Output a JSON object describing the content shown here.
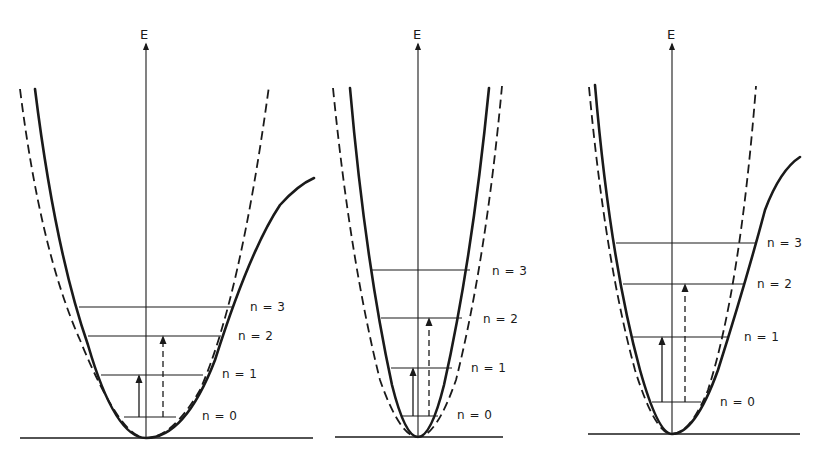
{
  "figure": {
    "ink_color": "#1a1a1a",
    "background": "#ffffff"
  },
  "panels": [
    {
      "id": "panel-1",
      "axis_label": "E",
      "axis": {
        "x": 146,
        "y_top": 44,
        "y_bottom": 438
      },
      "axis_label_pos": {
        "x": 140,
        "y": 29
      },
      "baseline": {
        "x1": 20,
        "x2": 313,
        "y": 438
      },
      "harmonic_dashed": "M20,89 Q40,250 80,340 Q120,438 146,438 Q172,438 200,390 Q240,300 269,86",
      "anharmonic_solid": "M35,89 Q55,250 88,345 Q115,438 146,438 Q185,438 215,360 Q250,250 280,205 Q298,185 314,178",
      "levels": [
        {
          "label": "n = 0",
          "y": 417,
          "x1": 124,
          "x2": 176,
          "label_x": 202,
          "label_y": 410
        },
        {
          "label": "n = 1",
          "y": 375,
          "x1": 101,
          "x2": 203,
          "label_x": 222,
          "label_y": 368
        },
        {
          "label": "n = 2",
          "y": 336,
          "x1": 88,
          "x2": 221,
          "label_x": 238,
          "label_y": 330
        },
        {
          "label": "n = 3",
          "y": 307,
          "x1": 79,
          "x2": 232,
          "label_x": 250,
          "label_y": 301
        }
      ],
      "solid_arrow": {
        "x": 139,
        "y_from": 417,
        "y_to": 375
      },
      "dashed_arrow": {
        "x": 163,
        "y_from": 417,
        "y_to": 336
      }
    },
    {
      "id": "panel-2",
      "axis_label": "E",
      "axis": {
        "x": 418,
        "y_top": 44,
        "y_bottom": 437
      },
      "axis_label_pos": {
        "x": 413,
        "y": 29
      },
      "baseline": {
        "x1": 335,
        "x2": 503,
        "y": 437
      },
      "harmonic_dashed": "M333,88 Q350,260 380,380 Q400,437 418,437 Q436,437 456,380 Q486,260 502,86",
      "anharmonic_solid": "M350,88 Q365,260 392,385 Q405,437 418,437 Q431,437 444,385 Q472,260 489,88",
      "levels": [
        {
          "label": "n = 0",
          "y": 416,
          "x1": 402,
          "x2": 438,
          "label_x": 457,
          "label_y": 409
        },
        {
          "label": "n = 1",
          "y": 368,
          "x1": 391,
          "x2": 452,
          "label_x": 471,
          "label_y": 362
        },
        {
          "label": "n = 2",
          "y": 318,
          "x1": 381,
          "x2": 462,
          "label_x": 483,
          "label_y": 313
        },
        {
          "label": "n = 3",
          "y": 270,
          "x1": 372,
          "x2": 470,
          "label_x": 492,
          "label_y": 265
        }
      ],
      "solid_arrow": {
        "x": 413,
        "y_from": 416,
        "y_to": 368
      },
      "dashed_arrow": {
        "x": 429,
        "y_from": 416,
        "y_to": 318
      }
    },
    {
      "id": "panel-3",
      "axis_label": "E",
      "axis": {
        "x": 672,
        "y_top": 44,
        "y_bottom": 434
      },
      "axis_label_pos": {
        "x": 667,
        "y": 29
      },
      "baseline": {
        "x1": 588,
        "x2": 800,
        "y": 434
      },
      "harmonic_dashed": "M589,87 Q605,260 635,370 Q655,434 672,434 Q690,434 708,390 Q740,290 756,86",
      "anharmonic_solid": "M595,85 Q610,260 640,370 Q658,434 672,434 Q695,434 718,370 Q745,285 765,210 Q780,170 800,157",
      "levels": [
        {
          "label": "n = 0",
          "y": 402,
          "x1": 652,
          "x2": 701,
          "label_x": 720,
          "label_y": 396
        },
        {
          "label": "n = 1",
          "y": 337,
          "x1": 633,
          "x2": 728,
          "label_x": 744,
          "label_y": 331
        },
        {
          "label": "n = 2",
          "y": 284,
          "x1": 623,
          "x2": 745,
          "label_x": 757,
          "label_y": 278
        },
        {
          "label": "n = 3",
          "y": 243,
          "x1": 616,
          "x2": 755,
          "label_x": 767,
          "label_y": 237
        }
      ],
      "solid_arrow": {
        "x": 662,
        "y_from": 402,
        "y_to": 337
      },
      "dashed_arrow": {
        "x": 685,
        "y_from": 402,
        "y_to": 284
      }
    }
  ]
}
